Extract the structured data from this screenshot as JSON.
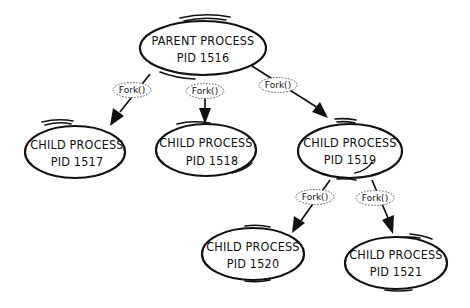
{
  "diagram": {
    "type": "process-tree",
    "nodes": [
      {
        "id": "parent",
        "title": "PARENT PROCESS",
        "pid_label": "PID 1516"
      },
      {
        "id": "c1517",
        "title": "CHILD PROCESS",
        "pid_label": "PID 1517"
      },
      {
        "id": "c1518",
        "title": "CHILD PROCESS",
        "pid_label": "PID 1518"
      },
      {
        "id": "c1519",
        "title": "CHILD PROCESS",
        "pid_label": "PID 1519"
      },
      {
        "id": "c1520",
        "title": "CHILD PROCESS",
        "pid_label": "PID 1520"
      },
      {
        "id": "c1521",
        "title": "CHILD PROCESS",
        "pid_label": "PID 1521"
      }
    ],
    "edges": [
      {
        "from": "parent",
        "to": "c1517",
        "label": "Fork()"
      },
      {
        "from": "parent",
        "to": "c1518",
        "label": "Fork()"
      },
      {
        "from": "parent",
        "to": "c1519",
        "label": "Fork()"
      },
      {
        "from": "c1519",
        "to": "c1520",
        "label": "Fork()"
      },
      {
        "from": "c1519",
        "to": "c1521",
        "label": "Fork()"
      }
    ],
    "colors": {
      "ink": "#111111",
      "background": "#ffffff"
    }
  }
}
